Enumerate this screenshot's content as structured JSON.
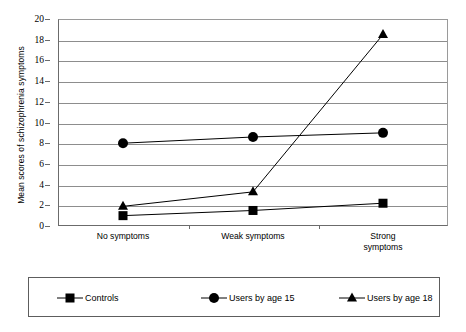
{
  "chart_data": {
    "type": "line",
    "title": "",
    "subtitle": "",
    "xlabel": "",
    "ylabel": "Mean scores of schizophrenia symptoms",
    "categories": [
      "No symptoms",
      "Weak symptoms",
      "Strong symptoms"
    ],
    "category_labels_multiline": [
      [
        "No symptoms"
      ],
      [
        "Weak symptoms"
      ],
      [
        "Strong",
        "symptoms"
      ]
    ],
    "ylim": [
      0,
      20
    ],
    "ytick_step": 2,
    "yticks": [
      0,
      2,
      4,
      6,
      8,
      10,
      12,
      14,
      16,
      18,
      20
    ],
    "ytick_labels": [
      "0",
      "2",
      "4",
      "6",
      "8",
      "10",
      "12",
      "14",
      "16",
      "18",
      "20"
    ],
    "grid": true,
    "grid_axis": "y",
    "legend_position": "bottom",
    "series": [
      {
        "name": "Controls",
        "marker": "square",
        "color": "#000000",
        "values": [
          1.0,
          1.5,
          2.2
        ]
      },
      {
        "name": "Users by age 15",
        "marker": "circle",
        "color": "#000000",
        "values": [
          8.0,
          8.6,
          9.0
        ]
      },
      {
        "name": "Users by age 18",
        "marker": "triangle",
        "color": "#000000",
        "values": [
          1.9,
          3.3,
          18.5
        ]
      }
    ]
  },
  "legend": {
    "entries": [
      {
        "label": "Controls",
        "marker": "square-marker-icon"
      },
      {
        "label": "Users by age 15",
        "marker": "circle-marker-icon"
      },
      {
        "label": "Users by age 18",
        "marker": "triangle-marker-icon"
      }
    ]
  },
  "colors": {
    "axis": "#6b6b6b",
    "grid": "#8d8d8d",
    "series": "#000000",
    "background": "#ffffff",
    "legend_border": "#5d5d5d"
  }
}
